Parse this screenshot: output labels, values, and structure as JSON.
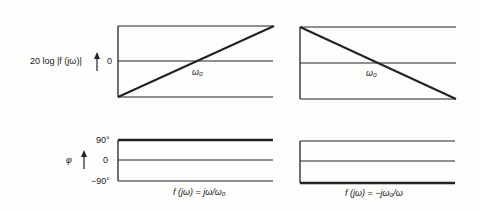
{
  "diagram": {
    "colors": {
      "line": "#222222",
      "background": "#fdfdfb"
    },
    "magnitude": {
      "ylabel": "20 log |f (jω)|",
      "zero_label": "0"
    },
    "phase": {
      "ylabel": "φ",
      "ticks": [
        "90°",
        "0",
        "−90°"
      ]
    },
    "panels": [
      {
        "id": "left",
        "caption": "f (jω) = jω/ω₀",
        "crossover_label": "ω₀",
        "magnitude_slope": "rising",
        "phase_value": "90°"
      },
      {
        "id": "right",
        "caption": "f (jω) = −jω₀/ω",
        "crossover_label": "ω₀",
        "magnitude_slope": "falling",
        "phase_value": "−90°"
      }
    ]
  }
}
